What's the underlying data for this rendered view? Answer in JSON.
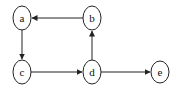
{
  "diagram": {
    "type": "directed-graph",
    "nodes": [
      {
        "id": "a",
        "label": "a",
        "cx": 22,
        "cy": 18
      },
      {
        "id": "b",
        "label": "b",
        "cx": 92,
        "cy": 18
      },
      {
        "id": "c",
        "label": "c",
        "cx": 22,
        "cy": 72
      },
      {
        "id": "d",
        "label": "d",
        "cx": 92,
        "cy": 72
      },
      {
        "id": "e",
        "label": "e",
        "cx": 160,
        "cy": 73
      }
    ],
    "edges": [
      {
        "from": "b",
        "to": "a"
      },
      {
        "from": "a",
        "to": "c"
      },
      {
        "from": "c",
        "to": "d"
      },
      {
        "from": "d",
        "to": "b"
      },
      {
        "from": "d",
        "to": "e"
      }
    ],
    "colors": {
      "stroke": "#222222",
      "fill": "#ffffff",
      "text": "#111111"
    }
  }
}
